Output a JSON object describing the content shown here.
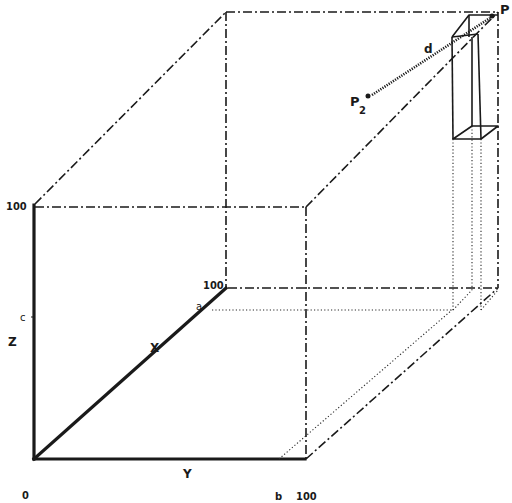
{
  "diagram": {
    "axes": {
      "x": {
        "label": "X",
        "max_label": "100",
        "marker_label": "a"
      },
      "y": {
        "label": "Y",
        "max_label": "100",
        "marker_label": "b"
      },
      "z": {
        "label": "Z",
        "max_label": "100",
        "marker_label": "c"
      },
      "origin_label": "0"
    },
    "points": [
      {
        "id": "P1",
        "label": "P",
        "subscript": "1"
      },
      {
        "id": "P2",
        "label": "P",
        "subscript": "2"
      }
    ],
    "distance_label": "d",
    "colors": {
      "line": "#1a1a1a",
      "background": "#ffffff"
    }
  }
}
